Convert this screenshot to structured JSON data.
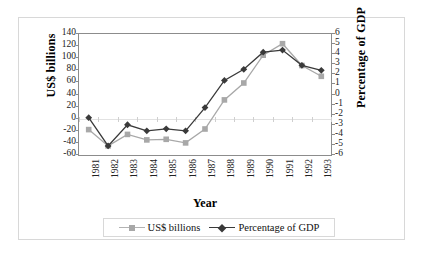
{
  "chart_data": {
    "type": "line",
    "title": "",
    "xlabel": "Year",
    "ylabel": "US$ billions",
    "y2label": "Percentage of GDP",
    "categories": [
      "1981",
      "1982",
      "1983",
      "1984",
      "1985",
      "1986",
      "1987",
      "1988",
      "1989",
      "1990",
      "1991",
      "1992",
      "1993"
    ],
    "ylim": [
      -60,
      140
    ],
    "y2lim": [
      -6,
      6
    ],
    "yticks": [
      "140",
      "120",
      "100",
      "80",
      "60",
      "40",
      "20",
      "0",
      "-20",
      "-40",
      "-60"
    ],
    "y2ticks": [
      "6",
      "5",
      "4",
      "3",
      "2",
      "1",
      "0",
      "-1",
      "-2",
      "-3",
      "-4",
      "-5",
      "-6"
    ],
    "grid": false,
    "legend_position": "bottom",
    "series": [
      {
        "name": "US$ billions",
        "axis": "left",
        "marker": "square",
        "color": "#a8a8a8",
        "values": [
          -18,
          -45,
          -26,
          -35,
          -34,
          -40,
          -17,
          31,
          59,
          105,
          124,
          88,
          70
        ]
      },
      {
        "name": "Percentage of GDP",
        "axis": "right",
        "marker": "diamond",
        "color": "#3a3a3a",
        "values": [
          -2.3,
          -5.1,
          -3.0,
          -3.6,
          -3.4,
          -3.6,
          -1.3,
          1.4,
          2.5,
          4.2,
          4.4,
          2.9,
          2.4
        ]
      }
    ]
  },
  "legend": {
    "items": [
      {
        "label": "US$ billions"
      },
      {
        "label": "Percentage of GDP"
      }
    ]
  },
  "axis_titles": {
    "left": "US$ billions",
    "right": "Percentage of GDP",
    "bottom": "Year"
  }
}
